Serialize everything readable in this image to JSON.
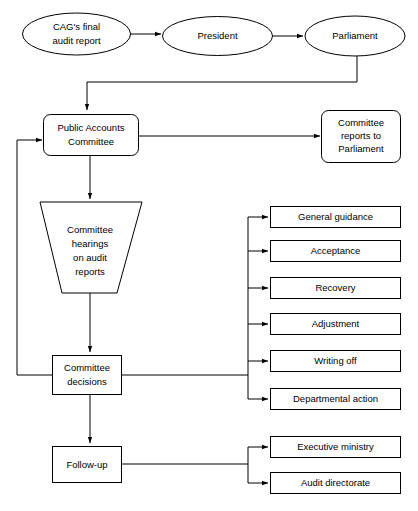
{
  "diagram": {
    "colors": {
      "stroke": "#000000",
      "fill": "#ffffff",
      "text": "#000000",
      "background": "#ffffff"
    },
    "nodes": {
      "cag_report": {
        "label_line1": "CAG's final",
        "label_line2": "audit report",
        "shape": "ellipse"
      },
      "president": {
        "label_line1": "President",
        "shape": "ellipse"
      },
      "parliament": {
        "label_line1": "Parliament",
        "shape": "ellipse"
      },
      "public_accounts_committee": {
        "label_line1": "Public Accounts",
        "label_line2": "Committee",
        "shape": "rounded-rect"
      },
      "committee_reports": {
        "label_line1": "Committee",
        "label_line2": "reports to",
        "label_line3": "Parliament",
        "shape": "rounded-rect"
      },
      "committee_hearings": {
        "label_line1": "Committee",
        "label_line2": "hearings",
        "label_line3": "on audit",
        "label_line4": "reports",
        "shape": "trapezoid"
      },
      "committee_decisions": {
        "label_line1": "Committee",
        "label_line2": "decisions",
        "shape": "rect"
      },
      "follow_up": {
        "label_line1": "Follow-up",
        "shape": "rect"
      }
    },
    "decision_outcomes": [
      {
        "label": "General guidance"
      },
      {
        "label": "Acceptance"
      },
      {
        "label": "Recovery"
      },
      {
        "label": "Adjustment"
      },
      {
        "label": "Writing off"
      },
      {
        "label": "Departmental action"
      }
    ],
    "followup_targets": [
      {
        "label": "Executive ministry"
      },
      {
        "label": "Audit directorate"
      }
    ]
  }
}
